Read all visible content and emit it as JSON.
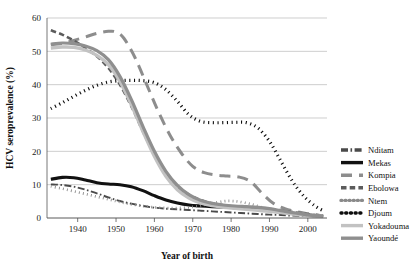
{
  "chart_data": {
    "type": "line",
    "title": "",
    "xlabel": "Year of birth",
    "ylabel": "HCV seroprevalence (%)",
    "xlim": [
      1932,
      2005
    ],
    "ylim": [
      0,
      60
    ],
    "xticks": [
      1940,
      1950,
      1960,
      1970,
      1980,
      1990,
      2000
    ],
    "xtick_labels": [
      "1940",
      "1950",
      "1960",
      "1970",
      "1980",
      "1990",
      "2000"
    ],
    "yticks": [
      0,
      10,
      20,
      30,
      40,
      50,
      60
    ],
    "ytick_labels": [
      "0",
      "10",
      "20",
      "30",
      "40",
      "50",
      "60"
    ],
    "grid": "horizontal",
    "legend_position": "right-outside",
    "series": [
      {
        "name": "Nditam",
        "color": "#4a4a4a",
        "width": 1.9,
        "dash": "7,2.5,1.6,2.5",
        "x": [
          1933,
          1936,
          1939,
          1942,
          1945,
          1948,
          1951,
          1954,
          1957,
          1960,
          1963,
          1966,
          1969,
          1972,
          1975,
          1978,
          1981,
          1984,
          1987,
          1990,
          1993,
          1996,
          1999,
          2002,
          2004
        ],
        "y": [
          10.1,
          9.9,
          9.4,
          8.5,
          7.4,
          6.2,
          5.1,
          4.3,
          3.6,
          3.1,
          2.8,
          2.6,
          2.4,
          2.2,
          2.0,
          1.8,
          1.6,
          1.4,
          1.2,
          1.0,
          0.9,
          0.7,
          0.6,
          0.5,
          0.4
        ]
      },
      {
        "name": "Mekas",
        "color": "#111111",
        "width": 3.1,
        "dash": "none",
        "x": [
          1933,
          1936,
          1939,
          1942,
          1945,
          1948,
          1951,
          1954,
          1957,
          1960,
          1963,
          1966,
          1969,
          1972,
          1975,
          1978,
          1981,
          1984,
          1987,
          1990,
          1993,
          1996,
          1999,
          2002,
          2004
        ],
        "y": [
          11.6,
          12.2,
          12.1,
          11.4,
          10.6,
          10.2,
          10.0,
          9.4,
          8.2,
          6.7,
          5.4,
          4.5,
          3.9,
          3.6,
          3.4,
          3.3,
          3.2,
          3.1,
          2.9,
          2.4,
          1.9,
          1.4,
          1.0,
          0.7,
          0.5
        ]
      },
      {
        "name": "Kompia",
        "color": "#8d8d8d",
        "width": 3.0,
        "dash": "11,7",
        "x": [
          1933,
          1936,
          1939,
          1942,
          1945,
          1948,
          1950,
          1952,
          1955,
          1958,
          1961,
          1964,
          1967,
          1970,
          1973,
          1976,
          1979,
          1982,
          1985,
          1988,
          1991,
          1994,
          1997,
          2000,
          2003
        ],
        "y": [
          52.0,
          52.4,
          53.3,
          54.3,
          55.4,
          56.0,
          55.8,
          54.0,
          48.0,
          40.0,
          32.0,
          25.0,
          19.5,
          15.5,
          13.6,
          12.9,
          12.6,
          12.3,
          11.0,
          7.5,
          4.4,
          2.8,
          1.9,
          1.3,
          0.8
        ]
      },
      {
        "name": "Ebolowa",
        "color": "#5c5c5c",
        "width": 2.6,
        "dash": "5.5,3.2",
        "x": [
          1933,
          1936,
          1939,
          1942,
          1945,
          1948,
          1951,
          1954,
          1957,
          1960,
          1963,
          1966,
          1969,
          1972,
          1975,
          1978,
          1981,
          1984,
          1987,
          1990,
          1993,
          1996,
          1999,
          2002,
          2004
        ],
        "y": [
          56.3,
          55.0,
          53.2,
          51.0,
          48.5,
          45.0,
          40.0,
          33.5,
          26.0,
          19.0,
          13.5,
          9.5,
          7.0,
          5.4,
          4.4,
          3.8,
          3.4,
          3.1,
          2.9,
          2.7,
          2.3,
          1.8,
          1.3,
          0.9,
          0.6
        ]
      },
      {
        "name": "Ntem",
        "color": "#8a8a8a",
        "width": 2.7,
        "dash": "0.9,3.2",
        "x": [
          1933,
          1936,
          1939,
          1942,
          1945,
          1948,
          1951,
          1954,
          1957,
          1960,
          1963,
          1966,
          1969,
          1972,
          1975,
          1978,
          1980,
          1982,
          1985,
          1988,
          1991,
          1994,
          1997,
          2000,
          2003
        ],
        "y": [
          9.5,
          8.8,
          8.0,
          7.2,
          6.4,
          5.6,
          4.8,
          4.1,
          3.6,
          3.2,
          3.0,
          3.0,
          3.2,
          3.7,
          4.4,
          5.0,
          5.1,
          4.9,
          4.2,
          3.2,
          2.3,
          1.7,
          1.2,
          0.8,
          0.5
        ]
      },
      {
        "name": "Djoum",
        "color": "#0d0d0d",
        "width": 3.2,
        "dash": "1.1,3.6",
        "x": [
          1933,
          1936,
          1939,
          1942,
          1945,
          1948,
          1951,
          1954,
          1957,
          1960,
          1963,
          1966,
          1969,
          1972,
          1975,
          1978,
          1981,
          1984,
          1987,
          1990,
          1993,
          1996,
          1999,
          2002,
          2004
        ],
        "y": [
          32.8,
          34.6,
          36.5,
          38.3,
          39.8,
          40.8,
          41.2,
          41.3,
          41.2,
          40.6,
          38.5,
          35.0,
          31.0,
          29.0,
          28.6,
          28.6,
          28.7,
          28.6,
          27.0,
          23.0,
          17.0,
          11.0,
          6.5,
          3.5,
          2.2
        ]
      },
      {
        "name": "Yokadouma",
        "color": "#c2c2c2",
        "width": 3.4,
        "dash": "none",
        "x": [
          1933,
          1936,
          1939,
          1942,
          1945,
          1948,
          1951,
          1954,
          1957,
          1960,
          1963,
          1966,
          1969,
          1972,
          1975,
          1978,
          1981,
          1984,
          1987,
          1990,
          1993,
          1996,
          1999,
          2002,
          2004
        ],
        "y": [
          51.0,
          51.3,
          51.2,
          50.4,
          48.8,
          46.0,
          41.0,
          34.0,
          26.0,
          18.5,
          12.5,
          8.5,
          6.0,
          4.5,
          3.7,
          3.2,
          2.9,
          2.6,
          2.3,
          2.0,
          1.6,
          1.2,
          0.9,
          0.6,
          0.4
        ]
      },
      {
        "name": "Yaoundé",
        "color": "#8f8f8f",
        "width": 3.2,
        "dash": "none",
        "x": [
          1933,
          1936,
          1939,
          1942,
          1945,
          1948,
          1951,
          1954,
          1957,
          1960,
          1963,
          1966,
          1969,
          1972,
          1975,
          1978,
          1981,
          1984,
          1987,
          1990,
          1993,
          1996,
          1999,
          2002,
          2004
        ],
        "y": [
          52.2,
          52.5,
          52.3,
          51.6,
          50.2,
          47.5,
          42.5,
          35.5,
          27.5,
          20.0,
          14.0,
          9.8,
          7.0,
          5.3,
          4.4,
          3.9,
          3.6,
          3.4,
          3.2,
          2.8,
          2.2,
          1.6,
          1.1,
          0.7,
          0.5
        ]
      }
    ]
  }
}
